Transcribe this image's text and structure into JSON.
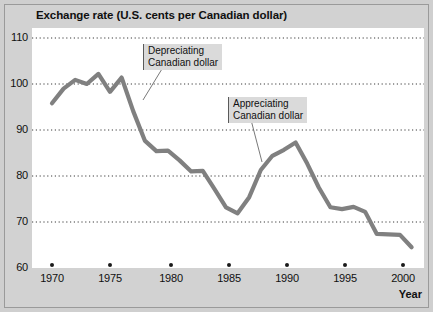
{
  "figure": {
    "title": "Exchange rate (U.S. cents per Canadian dollar)",
    "xaxis_label": "Year",
    "line_color": "#808080",
    "gridline_color": "#444444",
    "plot_background": "#ffffff",
    "page_background": "#cfcfcf"
  },
  "annotations": {
    "depreciating": {
      "line1": "Depreciating",
      "line2": "Canadian dollar"
    },
    "appreciating": {
      "line1": "Appreciating",
      "line2": "Canadian dollar"
    }
  },
  "chart_data": {
    "type": "line",
    "title": "Exchange rate (U.S. cents per Canadian dollar)",
    "xlabel": "Year",
    "ylabel": "",
    "xlim": [
      1969,
      2002
    ],
    "ylim": [
      60,
      110
    ],
    "yticks": [
      60,
      70,
      80,
      90,
      100,
      110
    ],
    "xticks": [
      1970,
      1975,
      1980,
      1985,
      1990,
      1995,
      2000
    ],
    "grid": true,
    "legend": false,
    "series": [
      {
        "name": "Exchange rate (U.S. cents per Canadian dollar)",
        "x": [
          1970,
          1971,
          1972,
          1973,
          1974,
          1975,
          1976,
          1977,
          1978,
          1979,
          1980,
          1981,
          1982,
          1983,
          1984,
          1985,
          1986,
          1987,
          1988,
          1989,
          1990,
          1991,
          1992,
          1993,
          1994,
          1995,
          1996,
          1997,
          1998,
          1999,
          2000,
          2001
        ],
        "values": [
          95.8,
          99.0,
          100.9,
          100.0,
          102.2,
          98.3,
          101.4,
          94.1,
          87.7,
          85.4,
          85.5,
          83.4,
          81.0,
          81.1,
          77.2,
          73.2,
          71.9,
          75.4,
          81.3,
          84.4,
          85.7,
          87.3,
          82.7,
          77.5,
          73.2,
          72.8,
          73.3,
          72.2,
          67.4,
          67.3,
          67.2,
          64.5
        ]
      }
    ],
    "annotations": [
      {
        "text": "Depreciating Canadian dollar",
        "box_position": {
          "x": 1979.5,
          "y": 107.0
        },
        "points_to": {
          "x": 1978.0,
          "y": 95.0
        }
      },
      {
        "text": "Appreciating Canadian dollar",
        "box_position": {
          "x": 1986.8,
          "y": 96.0
        },
        "points_to": {
          "x": 1988.2,
          "y": 80.0
        }
      }
    ]
  },
  "ytick_labels": [
    "110",
    "100",
    "90",
    "80",
    "70",
    "60"
  ],
  "xtick_labels": [
    "1970",
    "1975",
    "1980",
    "1985",
    "1990",
    "1995",
    "2000"
  ]
}
